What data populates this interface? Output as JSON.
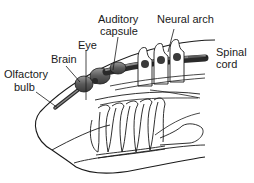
{
  "diagram": {
    "title": "",
    "labels": {
      "olfactory_bulb_1": "Olfactory",
      "olfactory_bulb_2": "bulb",
      "brain": "Brain",
      "eye": "Eye",
      "auditory_capsule_1": "Auditory",
      "auditory_capsule_2": "capsule",
      "neural_arch": "Neural arch",
      "spinal_cord_1": "Spinal",
      "spinal_cord_2": "cord"
    },
    "colors": {
      "ink": "#1a1a1a",
      "nerve_dark": "#4a4a4a",
      "nerve_mid": "#7a7a7a",
      "background": "#ffffff"
    }
  }
}
